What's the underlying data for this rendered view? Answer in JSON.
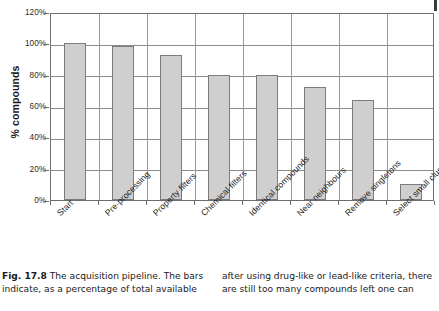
{
  "figure": {
    "corner_mark": "page-edge-mark",
    "caption": {
      "label": "Fig. 17.8",
      "left_text": " The acquisition pipeline. The bars indicate, as a percentage of total available",
      "right_text": "after using drug-like or lead-like criteria, there are still too many compounds left one can"
    }
  },
  "chart_data": {
    "type": "bar",
    "title": "",
    "xlabel": "",
    "ylabel": "% compounds",
    "ylim": [
      0,
      120
    ],
    "ytick_labels": [
      "0%",
      "20%",
      "40%",
      "60%",
      "80%",
      "100%",
      "120%"
    ],
    "ytick_values": [
      0,
      20,
      40,
      60,
      80,
      100,
      120
    ],
    "grid": "horizontal-and-vertical",
    "legend": "none",
    "bar_color": "#cfcfcf",
    "bar_edge_color": "#7b7b7b",
    "categories": [
      "Start",
      "Pre-processing",
      "Property filters",
      "Chemical filters",
      "Identical compounds",
      "Near neighbours",
      "Remove singletons",
      "Select small clusters"
    ],
    "values": [
      100,
      98,
      92.5,
      79.5,
      79.5,
      72,
      64,
      10
    ]
  }
}
